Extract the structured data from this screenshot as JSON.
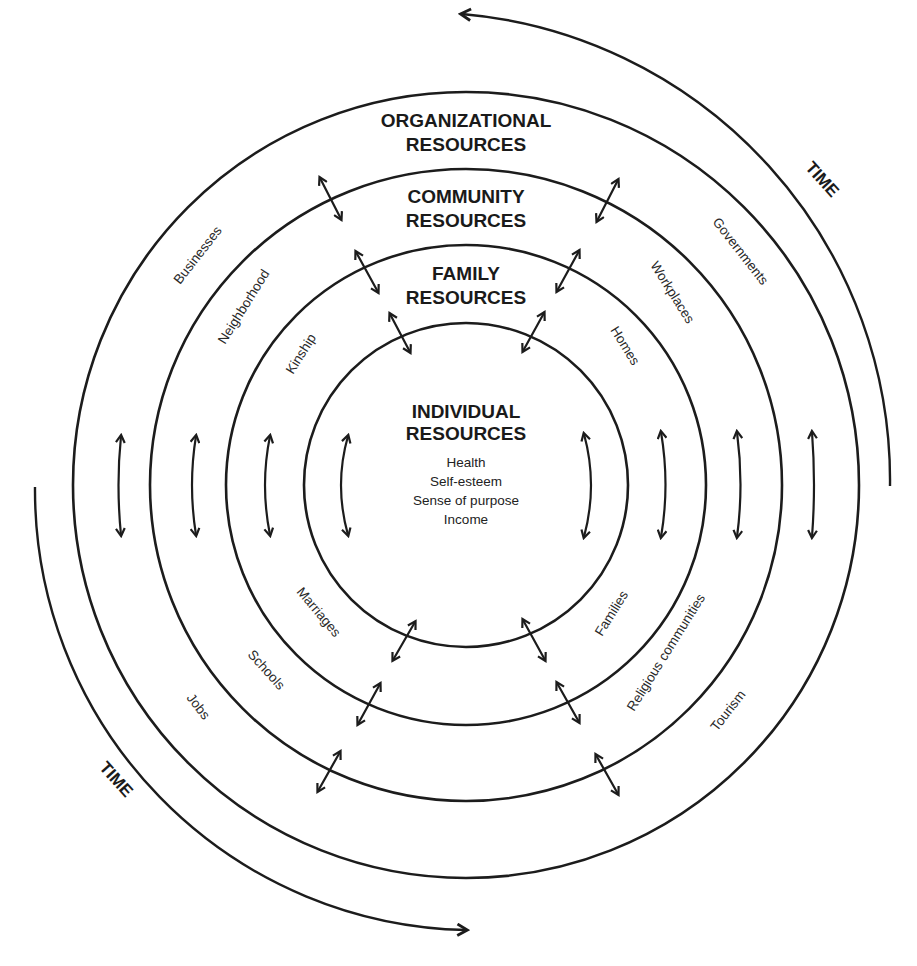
{
  "diagram": {
    "colors": {
      "organizational_fill": "#ffffff",
      "community_fill": "#e4e4e4",
      "family_fill": "#e0e0e0",
      "individual_fill": "#bdbdbd",
      "line": "#1c1c1c",
      "text": "#1a1a1a"
    },
    "rings": {
      "organizational": {
        "title_line1": "ORGANIZATIONAL",
        "title_line2": "RESOURCES",
        "examples": [
          "Businesses",
          "Governments",
          "Jobs",
          "Tourism"
        ]
      },
      "community": {
        "title_line1": "COMMUNITY",
        "title_line2": "RESOURCES",
        "examples": [
          "Neighborhood",
          "Workplaces",
          "Schools",
          "Religious communities"
        ]
      },
      "family": {
        "title_line1": "FAMILY",
        "title_line2": "RESOURCES",
        "examples": [
          "Kinship",
          "Homes",
          "Marriages",
          "Families"
        ]
      },
      "individual": {
        "title_line1": "INDIVIDUAL",
        "title_line2": "RESOURCES",
        "items": [
          "Health",
          "Self-esteem",
          "Sense of purpose",
          "Income"
        ]
      }
    },
    "time": {
      "top_label": "TIME",
      "bottom_label": "TIME"
    }
  }
}
